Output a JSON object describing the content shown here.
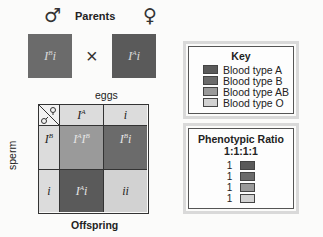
{
  "parents": {
    "title": "Parents",
    "male_symbol": "♂",
    "female_symbol": "♀",
    "cross_symbol": "×",
    "male_genotype": "IBi",
    "female_genotype": "IAi"
  },
  "punnett": {
    "eggs_label": "eggs",
    "sperm_label": "sperm",
    "corner_symbols": "♂♀",
    "columns": [
      "IA",
      "i"
    ],
    "rows": [
      "IB",
      "i"
    ],
    "cells": [
      [
        "IAIB",
        "IBi"
      ],
      [
        "IAi",
        "ii"
      ]
    ],
    "footer": "Offspring"
  },
  "key": {
    "title": "Key",
    "items": [
      {
        "label": "Blood type A",
        "color": "#5a5a5a"
      },
      {
        "label": "Blood type B",
        "color": "#6b6b6b"
      },
      {
        "label": "Blood type AB",
        "color": "#9a9a9a"
      },
      {
        "label": "Blood type O",
        "color": "#d2d2d2"
      }
    ]
  },
  "ratio": {
    "title": "Phenotypic Ratio",
    "value": "1:1:1:1",
    "items": [
      {
        "count": "1",
        "color": "#5a5a5a"
      },
      {
        "count": "1",
        "color": "#6b6b6b"
      },
      {
        "count": "1",
        "color": "#9a9a9a"
      },
      {
        "count": "1",
        "color": "#d2d2d2"
      }
    ]
  },
  "colors": {
    "type_a": "#5a5a5a",
    "type_b": "#6b6b6b",
    "type_ab": "#9a9a9a",
    "type_o": "#d2d2d2",
    "header": "#dcdcdc"
  }
}
